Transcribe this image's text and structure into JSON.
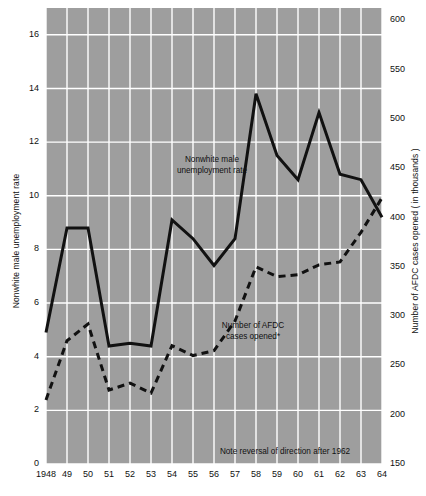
{
  "chart_data": {
    "type": "line",
    "title": "",
    "subtitle": "",
    "xlabel": "",
    "ylabel": "Nonwhite male unemployment rate",
    "y2label": "Number of AFDC cases opened  ( in thousands )",
    "grid": true,
    "legend_position": "inline-annotations",
    "plot_background_color": "#9e9e9e",
    "gridline_color": "#ffffff",
    "line_color": "#111111",
    "x": [
      1948,
      1949,
      1950,
      1951,
      1952,
      1953,
      1954,
      1955,
      1956,
      1957,
      1958,
      1959,
      1960,
      1961,
      1962,
      1963,
      1964
    ],
    "xtick_labels": [
      "1948",
      "49",
      "50",
      "51",
      "52",
      "53",
      "54",
      "55",
      "56",
      "57",
      "58",
      "59",
      "60",
      "61",
      "62",
      "63",
      "64"
    ],
    "ylim": [
      0,
      17
    ],
    "ytick_values": [
      0,
      2,
      4,
      6,
      8,
      10,
      12,
      14,
      16
    ],
    "ytick_labels": [
      "0",
      "2",
      "4",
      "6",
      "8",
      "10",
      "12",
      "14",
      "16"
    ],
    "y2lim": [
      150,
      612.5
    ],
    "y2tick_values": [
      150,
      200,
      250,
      300,
      350,
      400,
      450,
      500,
      550,
      600
    ],
    "y2tick_labels": [
      "150",
      "200",
      "250",
      "300",
      "350",
      "400",
      "450",
      "500",
      "550",
      "600"
    ],
    "series": [
      {
        "name": "Nonwhite male unemployment rate",
        "style": "solid",
        "axis": "left",
        "values": [
          4.9,
          8.8,
          8.8,
          4.4,
          4.5,
          4.4,
          9.1,
          8.4,
          7.4,
          8.4,
          13.8,
          11.5,
          10.6,
          13.1,
          10.8,
          10.6,
          9.2
        ]
      },
      {
        "name": "Number of AFDC cases opened*",
        "style": "dashed",
        "axis": "right",
        "values": [
          215,
          275,
          292,
          225,
          232,
          222,
          270,
          260,
          265,
          295,
          350,
          340,
          342,
          352,
          355,
          385,
          420
        ]
      }
    ],
    "annotations": [
      {
        "id": "series-1-label",
        "text_lines": [
          "Nonwhite male",
          "unemployment rate"
        ],
        "x_px": 212,
        "y_px": 154
      },
      {
        "id": "series-2-label",
        "text_lines": [
          "Number of AFDC",
          "cases opened*"
        ],
        "x_px": 253,
        "y_px": 320
      },
      {
        "id": "note-label",
        "text_lines": [
          "Note reversal of direction after 1962"
        ],
        "x_px": 285,
        "y_px": 446
      }
    ]
  }
}
